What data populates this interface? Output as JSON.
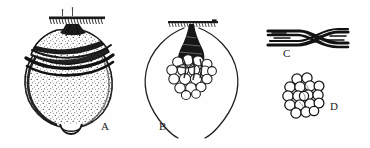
{
  "plate": {
    "kind": "scientific-line-illustration",
    "background_color": "#fefefe",
    "ink_color": "#1a1a1a",
    "panel_count": 4
  },
  "labels": {
    "a": "A",
    "b": "B",
    "c": "C",
    "d": "D"
  },
  "panels": [
    {
      "id": "a",
      "label": "A",
      "caption_position": "bottom-right",
      "description": "stippled bulb-shaped body attached by a short neck to a hatched substrate bar",
      "shading": "stipple",
      "substrate_bar": true
    },
    {
      "id": "b",
      "label": "B",
      "caption_position": "bottom-left",
      "description": "outline contour of the same body showing an internal cluster of rounded cells suspended from a dark tapering stalk",
      "shading": "outline",
      "substrate_bar": true
    },
    {
      "id": "c",
      "label": "C",
      "caption_position": "bottom-left",
      "description": "dark crossed or braided fibre strands running horizontally",
      "shading": "solid",
      "substrate_bar": false
    },
    {
      "id": "d",
      "label": "D",
      "caption_position": "right",
      "description": "packed rosette cluster of nineteen rounded cells in cross-section",
      "shading": "outline",
      "substrate_bar": false
    }
  ],
  "panel_d": {
    "cell_count": 19,
    "arrangement": "hexagonal-packed-rosette"
  }
}
